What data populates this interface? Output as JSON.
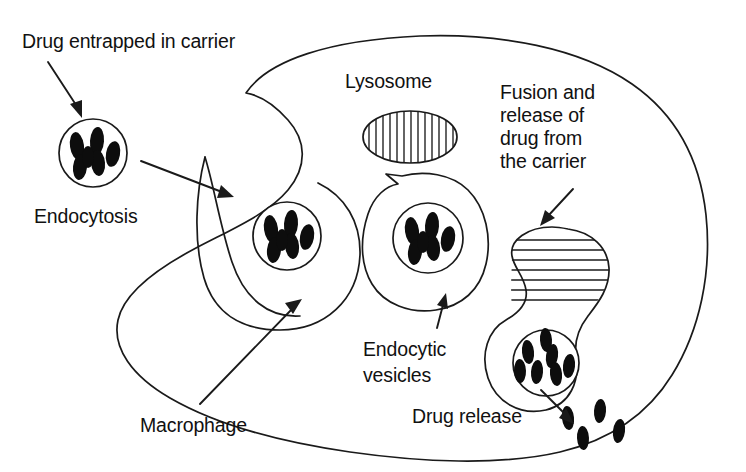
{
  "figure": {
    "width": 746,
    "height": 472,
    "background_color": "#ffffff",
    "ink_color": "#1a1a1a",
    "granule_color": "#0d0d0d"
  },
  "labels": {
    "drug_entrapped": "Drug entrapped in carrier",
    "endocytosis": "Endocytosis",
    "macrophage": "Macrophage",
    "lysosome": "Lysosome",
    "fusion_line1": "Fusion and",
    "fusion_line2": "release of",
    "fusion_line3": "drug from",
    "fusion_line4": "the carrier",
    "endocytic_line1": "Endocytic",
    "endocytic_line2": "vesicles",
    "drug_release": "Drug release"
  },
  "structures": [
    {
      "name": "macrophage-membrane",
      "kind": "cell-outline",
      "description": "Large irregular macrophage body with concave invagination on the left side"
    },
    {
      "name": "free-carrier",
      "kind": "circle-carrier",
      "description": "Drug entrapped in carrier outside the cell",
      "granule_count": 6
    },
    {
      "name": "endocytic-vesicle-1",
      "kind": "vesicle-with-carrier",
      "description": "Newly engulfed carrier within forming endocytic vesicle",
      "granule_count": 6
    },
    {
      "name": "endocytic-vesicle-2",
      "kind": "vesicle-with-carrier",
      "description": "Internalised endocytic vesicle containing carrier",
      "granule_count": 6
    },
    {
      "name": "lysosome",
      "kind": "ellipse-vertical-hatch",
      "description": "Lysosome drawn as ellipse with vertical hatching",
      "hatch_lines": 13,
      "hatch_direction": "vertical"
    },
    {
      "name": "fusion-body",
      "kind": "hourglass-fusion",
      "description": "Lysosome (horizontal hatch) fusing with endocytic vesicle containing drug granules",
      "hatch_lines": 7,
      "hatch_direction": "horizontal",
      "granule_count": 7
    },
    {
      "name": "released-drug",
      "kind": "free-granules",
      "description": "Free drug molecules released into cytoplasm",
      "granule_count": 4
    }
  ],
  "arrows": [
    {
      "name": "arrow-drug-entrapped",
      "from": "Drug entrapped in carrier label",
      "to": "free carrier"
    },
    {
      "name": "arrow-endocytosis",
      "from": "free carrier",
      "to": "macrophage membrane invagination"
    },
    {
      "name": "arrow-macrophage",
      "from": "Macrophage label",
      "to": "macrophage membrane"
    },
    {
      "name": "arrow-endocytic-vesicles",
      "from": "Endocytic vesicles label",
      "to": "endocytic vesicle"
    },
    {
      "name": "arrow-fusion",
      "from": "Fusion and release of drug from the carrier label",
      "to": "fusion body"
    },
    {
      "name": "arrow-drug-release",
      "from": "fusion vesicle",
      "to": "free drug granules"
    }
  ]
}
